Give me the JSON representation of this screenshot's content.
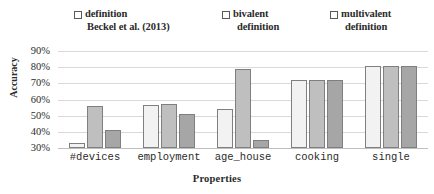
{
  "chart_data": {
    "type": "bar",
    "title": "",
    "xlabel": "Properties",
    "ylabel": "Accuracy",
    "categories": [
      "#devices",
      "employment",
      "age_house",
      "cooking",
      "single"
    ],
    "ylim": [
      30,
      90
    ],
    "ytick_labels": [
      "90%",
      "80%",
      "70%",
      "60%",
      "50%",
      "40%",
      "30%"
    ],
    "ytick_values": [
      90,
      80,
      70,
      60,
      50,
      40,
      30
    ],
    "grid": true,
    "legend_position": "top",
    "series": [
      {
        "name": "definition Beckel et al. (2013)",
        "name_line1": "definition",
        "name_line2": "Beckel et al. (2013)",
        "color": "#f2f2f2",
        "values": [
          33,
          56.5,
          54,
          72,
          80.5
        ]
      },
      {
        "name": "bivalent definition",
        "name_line1": "bivalent",
        "name_line2": "definition",
        "color": "#bfbfbf",
        "values": [
          56,
          57,
          79,
          72,
          80.5
        ]
      },
      {
        "name": "multivalent definition",
        "name_line1": "multivalent",
        "name_line2": "definition",
        "color": "#a6a6a6",
        "values": [
          41,
          51,
          35,
          72,
          80.5
        ]
      }
    ]
  }
}
